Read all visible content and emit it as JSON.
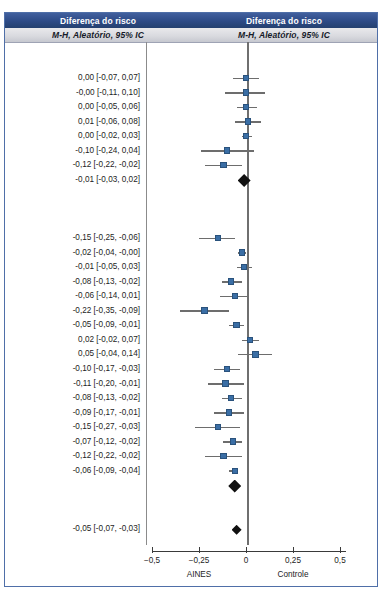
{
  "header": {
    "left_title": "Diferença do risco",
    "right_title": "Diferença do risco",
    "left_subtitle": "M-H, Aleatório, 95% IC",
    "right_subtitle": "M-H, Aleatório, 95% IC"
  },
  "colors": {
    "header_band": "#2d4a86",
    "subheader_band": "#d8d9de",
    "marker": "#3a6ea5",
    "whisker": "#6d6d6d",
    "diamond": "#111111",
    "zero_line": "#6f6f6f",
    "frame_border": "#4f6fa8"
  },
  "chart_data": {
    "type": "forest",
    "title": "Diferença do risco",
    "subtitle": "M-H, Aleatório, 95% IC",
    "xlabel": "",
    "ylabel": "",
    "xlim": [
      -0.5,
      0.5
    ],
    "grid": false,
    "legend": null,
    "axis_ticks": [
      {
        "value": -0.5,
        "label": "−0,5"
      },
      {
        "value": -0.25,
        "label": "−0,25"
      },
      {
        "value": 0,
        "label": "0"
      },
      {
        "value": 0.25,
        "label": "0,25"
      },
      {
        "value": 0.5,
        "label": "0,5"
      }
    ],
    "axis_group_labels": [
      {
        "value": -0.25,
        "label": "AINES"
      },
      {
        "value": 0.25,
        "label": "Controle"
      }
    ],
    "null_value": 0,
    "rows": [
      {
        "kind": "blank",
        "label": ""
      },
      {
        "kind": "blank",
        "label": ""
      },
      {
        "kind": "study",
        "label": "0,00 [-0,07, 0,07]",
        "effect": 0.0,
        "lower": -0.07,
        "upper": 0.07
      },
      {
        "kind": "study",
        "label": "-0,00 [-0,11, 0,10]",
        "effect": -0.0,
        "lower": -0.11,
        "upper": 0.1
      },
      {
        "kind": "study",
        "label": "0,00 [-0,05, 0,06]",
        "effect": 0.0,
        "lower": -0.05,
        "upper": 0.06
      },
      {
        "kind": "study",
        "label": "0,01 [-0,06, 0,08]",
        "effect": 0.01,
        "lower": -0.06,
        "upper": 0.08
      },
      {
        "kind": "study",
        "label": "0,00 [-0,02, 0,03]",
        "effect": 0.0,
        "lower": -0.02,
        "upper": 0.03
      },
      {
        "kind": "study",
        "label": "-0,10 [-0,24, 0,04]",
        "effect": -0.1,
        "lower": -0.24,
        "upper": 0.04
      },
      {
        "kind": "study",
        "label": "-0,12 [-0,22, -0,02]",
        "effect": -0.12,
        "lower": -0.22,
        "upper": -0.02
      },
      {
        "kind": "subtotal",
        "label": "-0,01 [-0,03, 0,02]",
        "effect": -0.01,
        "lower": -0.03,
        "upper": 0.02
      },
      {
        "kind": "blank",
        "label": ""
      },
      {
        "kind": "blank",
        "label": ""
      },
      {
        "kind": "blank",
        "label": ""
      },
      {
        "kind": "study",
        "label": "-0,15 [-0,25, -0,06]",
        "effect": -0.15,
        "lower": -0.25,
        "upper": -0.06
      },
      {
        "kind": "study",
        "label": "-0,02 [-0,04, -0,00]",
        "effect": -0.02,
        "lower": -0.04,
        "upper": -0.0
      },
      {
        "kind": "study",
        "label": "-0,01 [-0,05, 0,03]",
        "effect": -0.01,
        "lower": -0.05,
        "upper": 0.03
      },
      {
        "kind": "study",
        "label": "-0,08 [-0,13, -0,02]",
        "effect": -0.08,
        "lower": -0.13,
        "upper": -0.02
      },
      {
        "kind": "study",
        "label": "-0,06 [-0,14, 0,01]",
        "effect": -0.06,
        "lower": -0.14,
        "upper": 0.01
      },
      {
        "kind": "study",
        "label": "-0,22 [-0,35, -0,09]",
        "effect": -0.22,
        "lower": -0.35,
        "upper": -0.09
      },
      {
        "kind": "study",
        "label": "-0,05 [-0,09, -0,01]",
        "effect": -0.05,
        "lower": -0.09,
        "upper": -0.01
      },
      {
        "kind": "study",
        "label": "0,02 [-0,02, 0,07]",
        "effect": 0.02,
        "lower": -0.02,
        "upper": 0.07
      },
      {
        "kind": "study",
        "label": "0,05 [-0,04, 0,14]",
        "effect": 0.05,
        "lower": -0.04,
        "upper": 0.14
      },
      {
        "kind": "study",
        "label": "-0,10 [-0,17, -0,03]",
        "effect": -0.1,
        "lower": -0.17,
        "upper": -0.03
      },
      {
        "kind": "study",
        "label": "-0,11 [-0,20, -0,01]",
        "effect": -0.11,
        "lower": -0.2,
        "upper": -0.01
      },
      {
        "kind": "study",
        "label": "-0,08 [-0,13, -0,02]",
        "effect": -0.08,
        "lower": -0.13,
        "upper": -0.02
      },
      {
        "kind": "study",
        "label": "-0,09 [-0,17, -0,01]",
        "effect": -0.09,
        "lower": -0.17,
        "upper": -0.01
      },
      {
        "kind": "study",
        "label": "-0,15 [-0,27, -0,03]",
        "effect": -0.15,
        "lower": -0.27,
        "upper": -0.03
      },
      {
        "kind": "study",
        "label": "-0,07 [-0,12, -0,02]",
        "effect": -0.07,
        "lower": -0.12,
        "upper": -0.02
      },
      {
        "kind": "study",
        "label": "-0,12 [-0,22, -0,02]",
        "effect": -0.12,
        "lower": -0.22,
        "upper": -0.02
      },
      {
        "kind": "study",
        "label": "-0,06 [-0,09, -0,04]",
        "effect": -0.06,
        "lower": -0.09,
        "upper": -0.04
      },
      {
        "kind": "subtotal",
        "label": "",
        "effect": -0.06,
        "lower": -0.08,
        "upper": -0.04
      },
      {
        "kind": "blank",
        "label": ""
      },
      {
        "kind": "blank",
        "label": ""
      },
      {
        "kind": "total",
        "label": "-0,05 [-0,07, -0,03]",
        "effect": -0.05,
        "lower": -0.07,
        "upper": -0.03
      },
      {
        "kind": "blank",
        "label": ""
      }
    ]
  }
}
